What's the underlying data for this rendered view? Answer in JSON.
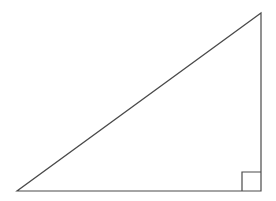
{
  "figure": {
    "width": 276,
    "height": 201,
    "background_color": "#ffffff",
    "stroke_color": "#4a4a4a",
    "stroke_width": 1.2
  },
  "diagram": {
    "type": "geometric-figure",
    "shape": "right triangle",
    "labels": [],
    "annotations": [],
    "vertices": {
      "left": {
        "name": "left-acute-vertex",
        "x": 17,
        "y": 191
      },
      "apex": {
        "name": "top-right-apex-vertex",
        "x": 261,
        "y": 13
      },
      "right_angle": {
        "name": "right-angle-vertex",
        "x": 261,
        "y": 191
      }
    },
    "edges": [
      {
        "name": "base-edge",
        "from": "left",
        "to": "right_angle"
      },
      {
        "name": "vertical-leg-edge",
        "from": "right_angle",
        "to": "apex"
      },
      {
        "name": "hypotenuse-edge",
        "from": "apex",
        "to": "left"
      }
    ],
    "right_angle_marker": {
      "name": "right-angle-square-marker",
      "x": 242,
      "y": 172,
      "size": 19,
      "corner_x": 261,
      "corner_y": 191
    },
    "triangle_path": "M 17 191 L 261 191 L 261 13 Z",
    "marker_path": "M 242 191 L 242 172 L 261 172"
  }
}
